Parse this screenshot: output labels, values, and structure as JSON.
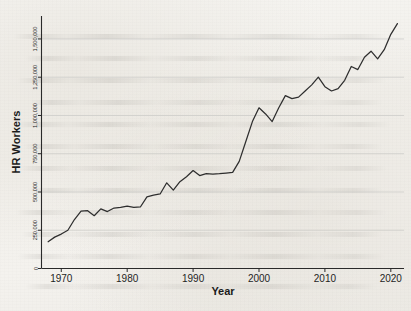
{
  "chart_data": {
    "type": "line",
    "title": "",
    "xlabel": "Year",
    "ylabel": "HR Workers",
    "grid": "horizontal",
    "legend": "none",
    "xlim": [
      1967.0,
      1922.0
    ],
    "xlim_actual": [
      1967.0,
      2022.0
    ],
    "ylim": [
      0,
      1650000
    ],
    "xticks": [
      1970,
      1980,
      1990,
      2000,
      2010,
      2020
    ],
    "xtick_labels": [
      "1970",
      "1980",
      "1990",
      "2000",
      "2010",
      "2020"
    ],
    "yticks": [
      0,
      250000,
      500000,
      750000,
      1000000,
      1250000,
      1500000
    ],
    "ytick_labels": [
      "0",
      "250,000",
      "500,000",
      "750,000",
      "1,000,000",
      "1,250,000",
      "1,500,000"
    ],
    "series": [
      {
        "name": "HR Workers",
        "color": "#2e2e2e",
        "x": [
          1968,
          1969,
          1970,
          1971,
          1972,
          1973,
          1974,
          1975,
          1976,
          1977,
          1978,
          1979,
          1980,
          1981,
          1982,
          1983,
          1984,
          1985,
          1986,
          1987,
          1988,
          1989,
          1990,
          1991,
          1992,
          1993,
          1994,
          1995,
          1996,
          1997,
          1998,
          1999,
          2000,
          2001,
          2002,
          2003,
          2004,
          2005,
          2006,
          2007,
          2008,
          2009,
          2010,
          2011,
          2012,
          2013,
          2014,
          2015,
          2016,
          2017,
          2018,
          2019,
          2020,
          2021
        ],
        "values": [
          175000,
          205000,
          225000,
          250000,
          320000,
          375000,
          378000,
          345000,
          390000,
          372000,
          395000,
          400000,
          408000,
          400000,
          402000,
          468000,
          480000,
          487000,
          560000,
          512000,
          567000,
          600000,
          640000,
          607000,
          620000,
          617000,
          620000,
          624000,
          628000,
          700000,
          830000,
          960000,
          1050000,
          1010000,
          960000,
          1050000,
          1130000,
          1110000,
          1120000,
          1160000,
          1200000,
          1250000,
          1188000,
          1160000,
          1175000,
          1230000,
          1320000,
          1300000,
          1380000,
          1420000,
          1370000,
          1430000,
          1530000,
          1600000
        ]
      }
    ]
  },
  "axes": {
    "ylabel": "HR Workers",
    "xlabel": "Year"
  }
}
